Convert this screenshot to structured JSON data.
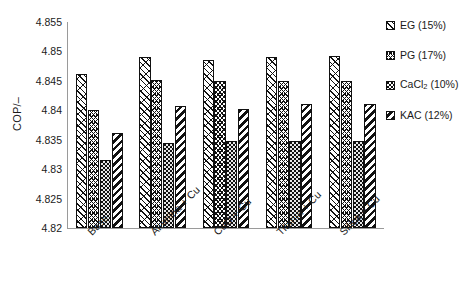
{
  "chart_data": {
    "type": "bar",
    "title": "",
    "xlabel": "",
    "ylabel": "COP/–",
    "ylim": [
      4.82,
      4.855
    ],
    "ytick_labels": [
      "4.82",
      "4.825",
      "4.83",
      "4.835",
      "4.84",
      "4.845",
      "4.85",
      "4.855"
    ],
    "ytick_values": [
      4.82,
      4.825,
      4.83,
      4.835,
      4.84,
      4.845,
      4.85,
      4.855
    ],
    "grid": false,
    "legend_position": "right",
    "categories": [
      "Base",
      "Alumina + Cu",
      "CuO + Cu",
      "Titania + Cu",
      "Silica + Cu"
    ],
    "series": [
      {
        "name": "EG (15%)",
        "pattern": "diagonal-hatch",
        "values": [
          4.8462,
          4.849,
          4.8485,
          4.849,
          4.8492
        ]
      },
      {
        "name": "PG (17%)",
        "pattern": "chevron-hatch",
        "values": [
          4.84,
          4.8452,
          4.845,
          4.845,
          4.845
        ]
      },
      {
        "name": "CaCl2 (10%)",
        "pattern": "dotted-stipple",
        "values": [
          4.8316,
          4.8345,
          4.8347,
          4.8348,
          4.8347
        ]
      },
      {
        "name": "KAC (12%)",
        "pattern": "bold-diagonal",
        "values": [
          4.8361,
          4.8408,
          4.8402,
          4.841,
          4.841
        ]
      }
    ]
  },
  "legend": {
    "items": [
      {
        "label": "EG (15%)",
        "label_main": "EG (15%)",
        "sub": "",
        "label_tail": ""
      },
      {
        "label": "PG (17%)",
        "label_main": "PG (17%)",
        "sub": "",
        "label_tail": ""
      },
      {
        "label": "CaCl2 (10%)",
        "label_main": "CaCl",
        "sub": "2",
        "label_tail": " (10%)"
      },
      {
        "label": "KAC (12%)",
        "label_main": "KAC (12%)",
        "sub": "",
        "label_tail": ""
      }
    ]
  },
  "axes": {
    "y_label": "COP/–",
    "y_ticks": [
      "4.855",
      "4.85",
      "4.845",
      "4.84",
      "4.835",
      "4.83",
      "4.825",
      "4.82"
    ],
    "x_ticks": [
      "Base",
      "Alumina + Cu",
      "CuO + Cu",
      "Titania + Cu",
      "Silica + Cu"
    ]
  },
  "colors": {
    "ink": "#111111",
    "axis": "#9a9a9a",
    "background": "#ffffff",
    "stipple_fill": "#e8e8e8"
  }
}
